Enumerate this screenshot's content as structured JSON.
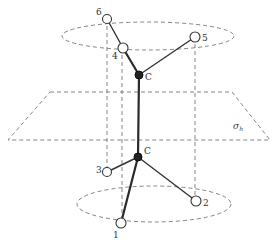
{
  "figure": {
    "plane_label": "σ",
    "plane_label_sub": "h",
    "carbon_label_upper": "C",
    "carbon_label_lower": "C",
    "atoms": [
      {
        "id": "1",
        "label": "1"
      },
      {
        "id": "2",
        "label": "2"
      },
      {
        "id": "3",
        "label": "3"
      },
      {
        "id": "4",
        "label": "4"
      },
      {
        "id": "5",
        "label": "5"
      },
      {
        "id": "6",
        "label": "6"
      }
    ]
  }
}
